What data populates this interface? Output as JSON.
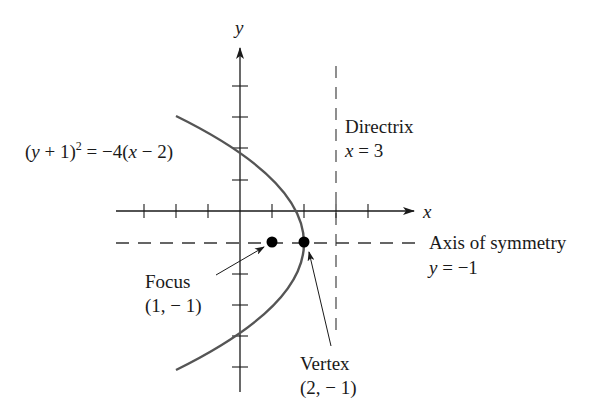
{
  "diagram": {
    "equation": {
      "lhs_open": "(",
      "lhs_var": "y",
      "lhs_rest": " + 1)",
      "exponent": "2",
      "rhs_prefix": " = −4(",
      "rhs_var": "x",
      "rhs_rest": " − 2)"
    },
    "axes": {
      "x_label": "x",
      "y_label": "y",
      "unit_px": 32,
      "origin_px": [
        240,
        211
      ]
    },
    "directrix": {
      "title": "Directrix",
      "eq_var": "x",
      "eq_rest": " = 3",
      "x_value": 3
    },
    "axis_of_symmetry": {
      "title": "Axis of symmetry",
      "eq_var": "y",
      "eq_rest": " = −1",
      "y_value": -1
    },
    "focus": {
      "title": "Focus",
      "coords": "(1, − 1)",
      "point": [
        1,
        -1
      ]
    },
    "vertex": {
      "title": "Vertex",
      "coords": "(2, − 1)",
      "point": [
        2,
        -1
      ]
    },
    "colors": {
      "curve": "#555555",
      "axes": "#1a1a1a",
      "dashes": "#333333",
      "points": "#000000"
    }
  }
}
